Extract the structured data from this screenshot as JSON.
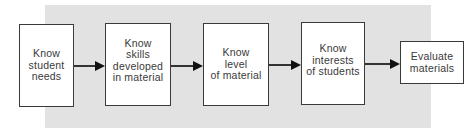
{
  "diagram": {
    "type": "flowchart",
    "direction": "left-to-right",
    "colors": {
      "background_panel": "#e2e2e2",
      "box_fill": "#ffffff",
      "box_border": "#3a3a3a",
      "text": "#3a3a3a",
      "arrow": "#111111"
    },
    "nodes": [
      {
        "id": "n1",
        "label": "Know\nstudent\nneeds"
      },
      {
        "id": "n2",
        "label": "Know\nskills\ndeveloped\nin material"
      },
      {
        "id": "n3",
        "label": "Know\nlevel\nof material"
      },
      {
        "id": "n4",
        "label": "Know\ninterests\nof students"
      },
      {
        "id": "n5",
        "label": "Evaluate\nmaterials"
      }
    ],
    "edges": [
      {
        "from": "n1",
        "to": "n2"
      },
      {
        "from": "n2",
        "to": "n3"
      },
      {
        "from": "n3",
        "to": "n4"
      },
      {
        "from": "n4",
        "to": "n5"
      }
    ]
  }
}
